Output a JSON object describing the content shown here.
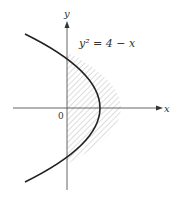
{
  "diagram": {
    "equation_label": "y² = 4 − x",
    "x_axis_label": "x",
    "y_axis_label": "y",
    "origin_label": "0",
    "shaded_region": "region bounded by y-axis and parabola for x ≥ 0",
    "colors": {
      "curve": "#222222",
      "axis": "#555555",
      "hatch": "#999999",
      "text": "#333333"
    }
  }
}
